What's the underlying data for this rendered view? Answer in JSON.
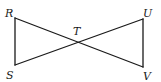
{
  "diagram": {
    "type": "geometry",
    "points": [
      {
        "id": "R",
        "label": "R"
      },
      {
        "id": "S",
        "label": "S"
      },
      {
        "id": "T",
        "label": "T"
      },
      {
        "id": "U",
        "label": "U"
      },
      {
        "id": "V",
        "label": "V"
      }
    ],
    "segments": [
      {
        "id": "RS",
        "from": "R",
        "to": "S"
      },
      {
        "id": "RV",
        "from": "R",
        "to": "V"
      },
      {
        "id": "SU",
        "from": "S",
        "to": "U"
      },
      {
        "id": "UV",
        "from": "U",
        "to": "V"
      }
    ],
    "stroke_color": "#1a1a1a",
    "background": "#ffffff"
  }
}
